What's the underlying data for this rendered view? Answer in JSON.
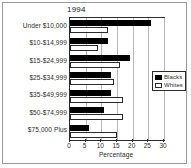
{
  "chart_data": {
    "type": "bar",
    "orientation": "horizontal",
    "title": "1994",
    "xlabel": "Percentage",
    "ylabel": "",
    "xlim": [
      0,
      30
    ],
    "xticks": [
      0,
      5,
      10,
      15,
      20,
      25,
      30
    ],
    "grid": true,
    "legend_position": "right",
    "categories": [
      "Under $10,000",
      "$10-$14,999",
      "$15-$24,999",
      "$25-$34,999",
      "$35-$49,999",
      "$50-$74,999",
      "$75,000 Plus"
    ],
    "series": [
      {
        "name": "Blacks",
        "color": "#000000",
        "values": [
          26,
          12,
          19,
          13,
          13,
          11,
          6
        ]
      },
      {
        "name": "Whites",
        "color": "#ffffff",
        "values": [
          12,
          9,
          16,
          14,
          17,
          17,
          15
        ]
      }
    ]
  },
  "legend": {
    "entries": [
      {
        "label": "Blacks"
      },
      {
        "label": "Whites"
      }
    ]
  }
}
